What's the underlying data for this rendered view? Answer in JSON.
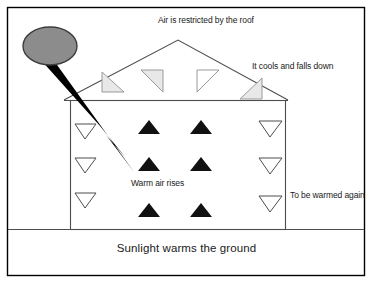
{
  "diagram": {
    "title_caption": "Sunlight warms the ground",
    "labels": {
      "roof_restrict": "Air is restricted by the roof",
      "cools_falls": "It cools and falls down",
      "warm_rises": "Warm air rises",
      "rewarm": "To be warmed again"
    },
    "colors": {
      "frame_border": "#000000",
      "background": "#ffffff",
      "sun_fill": "#8c8c8c",
      "sun_stroke": "#3d3d3d",
      "ray_fill": "#000000",
      "house_stroke": "#4d4d4d",
      "ground_stroke": "#4d4d4d",
      "rising_triangle_fill": "#111111",
      "falling_triangle_fill": "#ffffff",
      "falling_triangle_stroke": "#4d4d4d",
      "roof_triangle_fill": "#e6e6e6",
      "roof_triangle_stroke": "#999999",
      "text": "#1a1a1a"
    },
    "sun": {
      "name": "sun",
      "cx": 50,
      "cy": 46,
      "rx": 27,
      "ry": 19
    },
    "sun_ray": {
      "name": "sunbeam",
      "points": "33,52 41,46 136,171 108,138 127,156 103,130"
    },
    "house": {
      "wall_left": 70,
      "wall_right": 286,
      "wall_top": 100,
      "wall_bottom": 229,
      "roof_apex_x": 178,
      "roof_apex_y": 40,
      "roof_left_x": 64,
      "roof_left_y": 100,
      "roof_right_x": 288,
      "roof_right_y": 100
    },
    "ground": {
      "y": 229,
      "x1": 7,
      "x2": 366
    },
    "frame": {
      "x": 7,
      "y": 7,
      "width": 358,
      "height": 269
    },
    "rising_triangles": [
      {
        "cx": 149,
        "cy": 130
      },
      {
        "cx": 201,
        "cy": 130
      },
      {
        "cx": 149,
        "cy": 167
      },
      {
        "cx": 201,
        "cy": 167
      },
      {
        "cx": 149,
        "cy": 213
      },
      {
        "cx": 201,
        "cy": 213
      }
    ],
    "falling_triangles": [
      {
        "cx": 85,
        "cy": 131
      },
      {
        "cx": 85,
        "cy": 165
      },
      {
        "cx": 85,
        "cy": 200
      },
      {
        "cx": 271,
        "cy": 128
      },
      {
        "cx": 271,
        "cy": 165
      },
      {
        "cx": 271,
        "cy": 203
      }
    ],
    "roof_triangles": [
      {
        "name": "roof-triangle-1",
        "points": "102,72 102,92 124,92"
      },
      {
        "name": "roof-triangle-2",
        "points": "141,70 163,70 163,92"
      },
      {
        "name": "roof-triangle-3",
        "points": "197,70 219,70 197,92"
      },
      {
        "name": "roof-triangle-4",
        "points": "240,99 262,78 262,99"
      }
    ]
  }
}
